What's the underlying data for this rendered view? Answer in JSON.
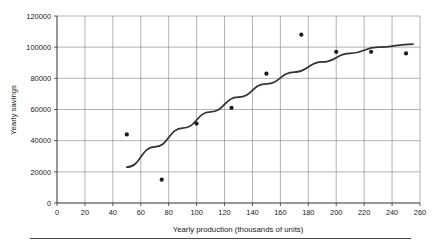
{
  "chart_data": {
    "type": "scatter",
    "title": "",
    "xlabel": "Yearly production (thousands of units)",
    "ylabel": "Yearly savings",
    "xlim": [
      0,
      260
    ],
    "ylim": [
      0,
      120000
    ],
    "xticks": [
      0,
      20,
      40,
      60,
      80,
      100,
      120,
      140,
      160,
      180,
      200,
      220,
      240,
      260
    ],
    "xtick_labels": [
      "0",
      "20",
      "40",
      "60",
      "80",
      "100",
      "120",
      "140",
      "160",
      "180",
      "200",
      "220",
      "240",
      "260"
    ],
    "yticks": [
      0,
      20000,
      40000,
      60000,
      80000,
      100000,
      120000
    ],
    "ytick_labels": [
      "0",
      "20000",
      "40000",
      "60000",
      "80000",
      "100000",
      "120000"
    ],
    "grid": true,
    "grid_color": "#808080",
    "legend": null,
    "point_color": "#1a1a1a",
    "line_color": "#333333",
    "x": [
      50,
      75,
      100,
      125,
      150,
      175,
      200,
      225,
      250
    ],
    "y": [
      44000,
      15000,
      51000,
      61000,
      83000,
      108000,
      97000,
      97000,
      96000
    ],
    "points": [
      {
        "x": 50,
        "y": 44000
      },
      {
        "x": 75,
        "y": 15000
      },
      {
        "x": 100,
        "y": 51000
      },
      {
        "x": 125,
        "y": 61000
      },
      {
        "x": 150,
        "y": 83000
      },
      {
        "x": 175,
        "y": 108000
      },
      {
        "x": 200,
        "y": 97000
      },
      {
        "x": 225,
        "y": 97000
      },
      {
        "x": 250,
        "y": 96000
      }
    ],
    "series": [
      {
        "name": "trend-curve",
        "type": "line",
        "x": [
          50,
          70,
          90,
          110,
          130,
          150,
          170,
          190,
          210,
          230,
          255
        ],
        "y": [
          23000,
          36000,
          48000,
          58500,
          68000,
          76500,
          84000,
          90500,
          96000,
          100000,
          102000
        ]
      }
    ]
  }
}
